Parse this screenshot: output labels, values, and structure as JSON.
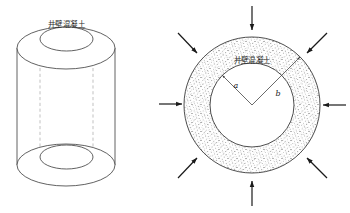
{
  "figure": {
    "title": "",
    "panels": [
      {
        "id": "left-cylinder",
        "name": "shaft-wall-cylinder-3d",
        "label": "井壁混凝土",
        "label_meaning": "shaft-wall-concrete",
        "shape": "hollow-cylinder"
      },
      {
        "id": "right-annulus",
        "name": "shaft-wall-annulus-section",
        "label": "井壁混凝土",
        "label_meaning": "shaft-wall-concrete",
        "shape": "annulus-cross-section",
        "inner_radius_label": "a",
        "outer_radius_label": "b",
        "load_arrow_count": 8,
        "load_arrow_directions": [
          "top",
          "top-right",
          "right",
          "bottom-right",
          "bottom",
          "bottom-left",
          "left",
          "top-left"
        ]
      }
    ]
  },
  "style": {
    "line_color": "#3a3a3a",
    "dashed_color": "#9a9a9a",
    "speckle_color": "#4a4a4a",
    "arrow_color": "#1a1a1a",
    "background": "#ffffff"
  }
}
